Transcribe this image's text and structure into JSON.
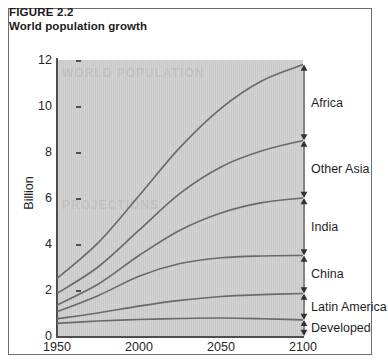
{
  "figure": {
    "number": "FIGURE 2.2",
    "title": "World population growth"
  },
  "colors": {
    "plot_background": "#c9c9c9",
    "curve": "#6a6a6a",
    "axis": "#4e4e4e",
    "frame_border": "#6f6f72",
    "text": "#1f1f1f",
    "page_background": "#ffffff"
  },
  "watermark": {
    "line1": "WORLD POPULATION",
    "line2": "PROJECTIONS"
  },
  "chart_data": {
    "type": "area",
    "title": "World population growth",
    "xlabel": "",
    "ylabel": "Billion",
    "xlim": [
      1950,
      2100
    ],
    "ylim": [
      0,
      12
    ],
    "xticks": [
      "1950",
      "2000",
      "2050",
      "2100"
    ],
    "xtick_values": [
      1950,
      2000,
      2050,
      2100
    ],
    "yticks": [
      "0",
      "2",
      "4",
      "6",
      "8",
      "10",
      "12"
    ],
    "ytick_values": [
      0,
      2,
      4,
      6,
      8,
      10,
      12
    ],
    "grid": false,
    "legend_position": "right-brackets",
    "stacked": true,
    "x": [
      1950,
      1975,
      2000,
      2025,
      2050,
      2075,
      2100
    ],
    "cumulative_series": [
      {
        "name": "Developed",
        "label": "Developed",
        "values": [
          0.55,
          0.65,
          0.72,
          0.76,
          0.78,
          0.75,
          0.7
        ]
      },
      {
        "name": "Latin America",
        "label": "Latin America",
        "values": [
          0.75,
          1.0,
          1.3,
          1.55,
          1.72,
          1.8,
          1.85
        ]
      },
      {
        "name": "China",
        "label": "China",
        "values": [
          1.05,
          1.75,
          2.6,
          3.15,
          3.4,
          3.48,
          3.5
        ]
      },
      {
        "name": "India",
        "label": "India",
        "values": [
          1.35,
          2.25,
          3.5,
          4.6,
          5.35,
          5.8,
          6.0
        ]
      },
      {
        "name": "Other Asia",
        "label": "Other Asia",
        "values": [
          1.85,
          3.0,
          4.6,
          6.2,
          7.35,
          8.05,
          8.5
        ]
      },
      {
        "name": "Africa",
        "label": "Africa",
        "values": [
          2.5,
          4.05,
          6.1,
          8.2,
          9.9,
          11.1,
          11.8
        ]
      }
    ],
    "brackets": [
      {
        "label": "Africa",
        "from": 8.5,
        "to": 11.8
      },
      {
        "label": "Other Asia",
        "from": 6.0,
        "to": 8.5
      },
      {
        "label": "India",
        "from": 3.5,
        "to": 6.0
      },
      {
        "label": "China",
        "from": 1.85,
        "to": 3.5
      },
      {
        "label": "Latin America",
        "from": 0.7,
        "to": 1.85
      },
      {
        "label": "Developed",
        "from": 0.0,
        "to": 0.7
      }
    ]
  }
}
